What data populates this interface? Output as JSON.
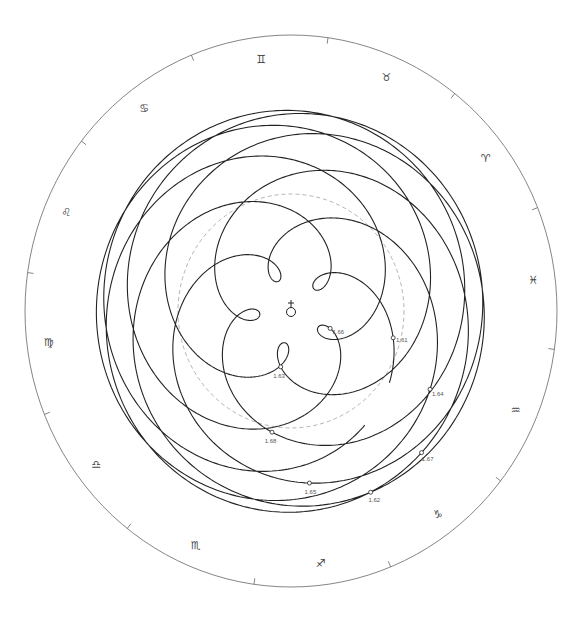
{
  "diagram": {
    "type": "geocentric-orbit-path",
    "center_symbol": "earth-icon",
    "center_glyph": "♁",
    "sun_orbit_style": "dashed",
    "colors": {
      "curve": "#222222",
      "outer_ring": "#777777",
      "sun_orbit": "#aaaaaa",
      "text": "#444444"
    },
    "zodiac_signs": [
      {
        "name": "Aries",
        "glyph": "♈"
      },
      {
        "name": "Taurus",
        "glyph": "♉"
      },
      {
        "name": "Gemini",
        "glyph": "♊"
      },
      {
        "name": "Cancer",
        "glyph": "♋"
      },
      {
        "name": "Leo",
        "glyph": "♌"
      },
      {
        "name": "Virgo",
        "glyph": "♍"
      },
      {
        "name": "Libra",
        "glyph": "♎"
      },
      {
        "name": "Scorpio",
        "glyph": "♏"
      },
      {
        "name": "Sagittarius",
        "glyph": "♐"
      },
      {
        "name": "Capricorn",
        "glyph": "♑"
      },
      {
        "name": "Aquarius",
        "glyph": "♒"
      },
      {
        "name": "Pisces",
        "glyph": "♓"
      }
    ],
    "year_markers": [
      {
        "label": "1.61",
        "year": 1961
      },
      {
        "label": "1.62",
        "year": 1962
      },
      {
        "label": "1.63",
        "year": 1963
      },
      {
        "label": "1.64",
        "year": 1964
      },
      {
        "label": "1.65",
        "year": 1965
      },
      {
        "label": "1.66",
        "year": 1966
      },
      {
        "label": "1.67",
        "year": 1967
      },
      {
        "label": "1.68",
        "year": 1968
      }
    ],
    "orbit_params": {
      "sun_distance_au": 1.0,
      "venus_orbit_au": 0.723,
      "venus_period_years": 0.6152,
      "start_year": 1960.95,
      "end_year": 1968.9
    }
  }
}
